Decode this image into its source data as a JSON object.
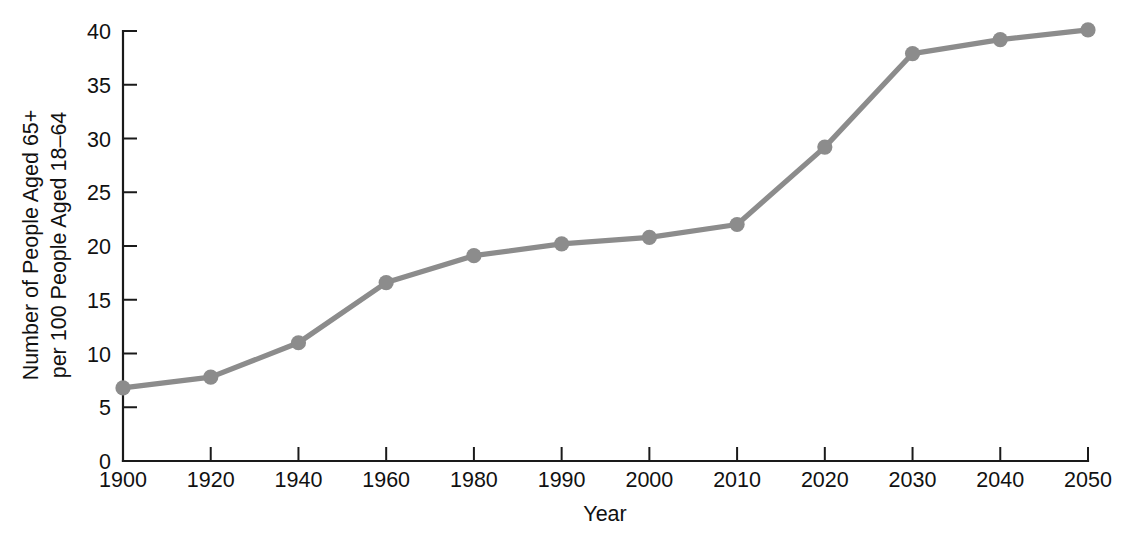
{
  "chart_data": {
    "type": "line",
    "title": "",
    "xlabel": "Year",
    "ylabel_line1": "Number of People Aged 65+",
    "ylabel_line2": "per 100 People Aged 18–64",
    "categories": [
      "1900",
      "1920",
      "1940",
      "1960",
      "1980",
      "1990",
      "2000",
      "2010",
      "2020",
      "2030",
      "2040",
      "2050"
    ],
    "values": [
      6.8,
      7.8,
      11.0,
      16.6,
      19.1,
      20.2,
      20.8,
      22.0,
      29.2,
      37.9,
      39.2,
      40.1
    ],
    "series": [
      {
        "name": "Old-age dependency ratio",
        "values": [
          6.8,
          7.8,
          11.0,
          16.6,
          19.1,
          20.2,
          20.8,
          22.0,
          29.2,
          37.9,
          39.2,
          40.1
        ]
      }
    ],
    "ylim": [
      0,
      40
    ],
    "ytick_labels": [
      "0",
      "5",
      "10",
      "15",
      "20",
      "25",
      "30",
      "35",
      "40"
    ],
    "ytick_values": [
      0,
      5,
      10,
      15,
      20,
      25,
      30,
      35,
      40
    ],
    "xtick_labels": [
      "1900",
      "1920",
      "1940",
      "1960",
      "1980",
      "1990",
      "2000",
      "2010",
      "2020",
      "2030",
      "2040",
      "2050"
    ],
    "grid": false,
    "legend": "none",
    "x_axis_spacing": "categorical-even",
    "line_color": "#8c8c8c",
    "marker_color": "#8c8c8c",
    "marker_shape": "circle",
    "axis_color": "#1a1a1a",
    "background_color": "#ffffff"
  }
}
